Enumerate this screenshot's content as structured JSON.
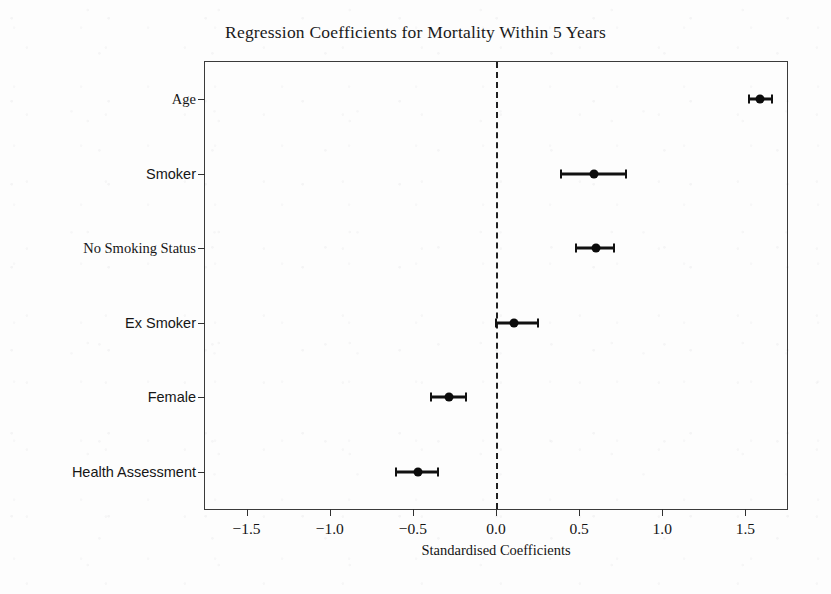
{
  "chart_data": {
    "type": "scatter",
    "title": "Regression Coefficients for Mortality Within 5 Years",
    "xlabel": "Standardised Coefficients",
    "ylabel": "",
    "xlim": [
      -1.75,
      1.75
    ],
    "xticks": [
      -1.5,
      -1.0,
      -0.5,
      0.0,
      0.5,
      1.0,
      1.5
    ],
    "xticklabels": [
      "−1.5",
      "−1.0",
      "−0.5",
      "0.0",
      "0.5",
      "1.0",
      "1.5"
    ],
    "grid": false,
    "legend": null,
    "reference_line": {
      "x": 0.0,
      "style": "dashed",
      "color": "#202020"
    },
    "categories": [
      "Age",
      "Smoker",
      "No Smoking Status",
      "Ex Smoker",
      "Female",
      "Health Assessment"
    ],
    "values": [
      1.59,
      0.59,
      0.6,
      0.11,
      -0.28,
      -0.47
    ],
    "ci_low": [
      1.52,
      0.39,
      0.48,
      0.0,
      -0.39,
      -0.6
    ],
    "ci_high": [
      1.66,
      0.78,
      0.71,
      0.25,
      -0.18,
      -0.35
    ],
    "points": [
      {
        "label": "Age",
        "value": 1.59,
        "ci_low": 1.52,
        "ci_high": 1.66,
        "label_font": "serif"
      },
      {
        "label": "Smoker",
        "value": 0.59,
        "ci_low": 0.39,
        "ci_high": 0.78,
        "label_font": "sans"
      },
      {
        "label": "No Smoking Status",
        "value": 0.6,
        "ci_low": 0.48,
        "ci_high": 0.71,
        "label_font": "serif"
      },
      {
        "label": "Ex Smoker",
        "value": 0.11,
        "ci_low": 0.0,
        "ci_high": 0.25,
        "label_font": "sans"
      },
      {
        "label": "Female",
        "value": -0.28,
        "ci_low": -0.39,
        "ci_high": -0.18,
        "label_font": "sans"
      },
      {
        "label": "Health Assessment",
        "value": -0.47,
        "ci_low": -0.6,
        "ci_high": -0.35,
        "label_font": "sans"
      }
    ],
    "marker_color": "#0b0b0b",
    "errorbar_color": "#111111",
    "axis_color": "#3b3b3b",
    "background_color": "#fdfdfd"
  }
}
